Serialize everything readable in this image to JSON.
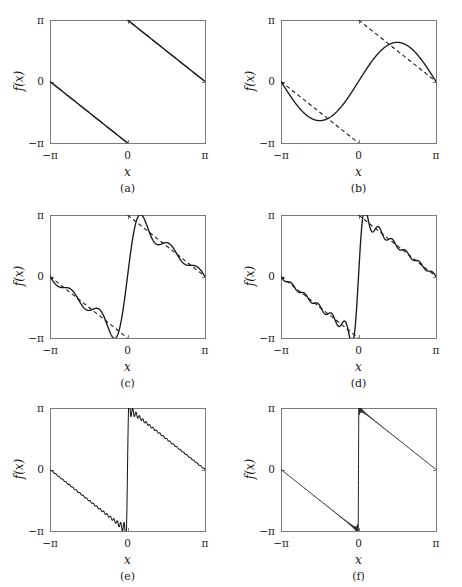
{
  "figure": {
    "background": "#ffffff",
    "frame_color": "#7a7a7a",
    "curve_color": "#1a1a1a",
    "dashed_color": "#1a1a1a",
    "panel_count": 6
  },
  "axes": {
    "xlabel": "x",
    "ylabel": "f(x)",
    "xticks": [
      "−π",
      "0",
      "π"
    ],
    "yticks": [
      "π",
      "0",
      "−π"
    ],
    "xlim": [
      -3.141592653589793,
      3.141592653589793
    ],
    "ylim": [
      -3.141592653589793,
      3.141592653589793
    ]
  },
  "panels": [
    {
      "id": "a",
      "caption": "(a)",
      "harmonics": 0,
      "show_target_dashed": false,
      "show_exact_solid": true
    },
    {
      "id": "b",
      "caption": "(b)",
      "harmonics": 1,
      "show_target_dashed": true,
      "show_exact_solid": false
    },
    {
      "id": "c",
      "caption": "(c)",
      "harmonics": 5,
      "show_target_dashed": true,
      "show_exact_solid": false
    },
    {
      "id": "d",
      "caption": "(d)",
      "harmonics": 11,
      "show_target_dashed": true,
      "show_exact_solid": false
    },
    {
      "id": "e",
      "caption": "(e)",
      "harmonics": 45,
      "show_target_dashed": false,
      "show_exact_solid": false
    },
    {
      "id": "f",
      "caption": "(f)",
      "harmonics": 160,
      "show_target_dashed": false,
      "show_exact_solid": false
    }
  ],
  "chart_data": {
    "type": "line",
    "title": "",
    "xlabel": "x",
    "ylabel": "f(x)",
    "xlim": [
      -3.141592653589793,
      3.141592653589793
    ],
    "ylim": [
      -3.141592653589793,
      3.141592653589793
    ],
    "xticks": [
      -3.141592653589793,
      0,
      3.141592653589793
    ],
    "xticklabels": [
      "−π",
      "0",
      "π"
    ],
    "yticks": [
      3.141592653589793,
      0,
      -3.141592653589793
    ],
    "yticklabels": [
      "π",
      "0",
      "−π"
    ],
    "grid": false,
    "legend": "none",
    "target_function": {
      "name": "sawtooth",
      "formula": "f(x) = -x - pi for -pi<x<0 ; -x + pi for 0<x<pi",
      "description": "Descending sawtooth with jump discontinuity of height 2*pi at x = 0; value 0 at x = -pi and x = pi, approaching -pi from the left of 0 and +pi from the right of 0.",
      "endpoints": [
        {
          "x": -3.141592653589793,
          "y": 0
        },
        {
          "x": 0,
          "y": -3.141592653589793
        },
        {
          "x": 0,
          "y": 3.141592653589793
        },
        {
          "x": 3.141592653589793,
          "y": 0
        }
      ]
    },
    "approximation": {
      "name": "Fourier sine partial sum",
      "formula": "S_N(x) = sum_{n=1..N} (2/n) * sin(n*x)",
      "coefficient": "b_n = 2/n"
    },
    "series": [
      {
        "name": "(a) exact sawtooth",
        "harmonics": 0,
        "style": "solid"
      },
      {
        "name": "(b) N = 1",
        "harmonics": 1,
        "style": "solid + dashed target"
      },
      {
        "name": "(c) N = 5",
        "harmonics": 5,
        "style": "solid + dashed target"
      },
      {
        "name": "(d) N = 11",
        "harmonics": 11,
        "style": "solid + dashed target"
      },
      {
        "name": "(e) N = 45",
        "harmonics": 45,
        "style": "solid"
      },
      {
        "name": "(f) N = 160",
        "harmonics": 160,
        "style": "solid"
      }
    ],
    "phenomenon": "Gibbs phenomenon: overshoot near the x = 0 discontinuity persists at about 9% of the jump as N increases, while the ripples narrow."
  }
}
